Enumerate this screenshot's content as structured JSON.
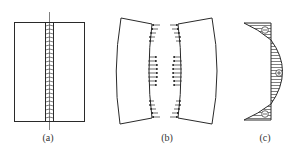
{
  "figure": {
    "panels": [
      {
        "id": "a",
        "label": "(a)",
        "description": "Welded plate with central longitudinal weld bead"
      },
      {
        "id": "b",
        "label": "(b)",
        "description": "Plate halves with arrows indicating weld shrinkage forces"
      },
      {
        "id": "c",
        "label": "(c)",
        "description": "Residual stress distribution along the weld"
      }
    ],
    "stress_signs": {
      "top": "−",
      "middle": "+",
      "bottom": "−"
    },
    "colors": {
      "stroke": "#2a2a2a",
      "background": "#ffffff"
    }
  }
}
